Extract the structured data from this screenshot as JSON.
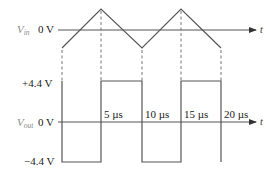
{
  "figure": {
    "input": {
      "label_main": "V",
      "label_sub": "in",
      "zero_label": "0 V",
      "time_axis_label": "t"
    },
    "output": {
      "label_main": "V",
      "label_sub": "out",
      "zero_label": "0 V",
      "high_label": "+4.4 V",
      "low_label": "−4.4 V",
      "time_axis_label": "t",
      "time_ticks": [
        "5 µs",
        "10 µs",
        "15 µs",
        "20 µs"
      ]
    },
    "colors": {
      "waveform": "#555555",
      "labels": "#1a1a1a",
      "signal_names": "#8a8a8a"
    }
  }
}
